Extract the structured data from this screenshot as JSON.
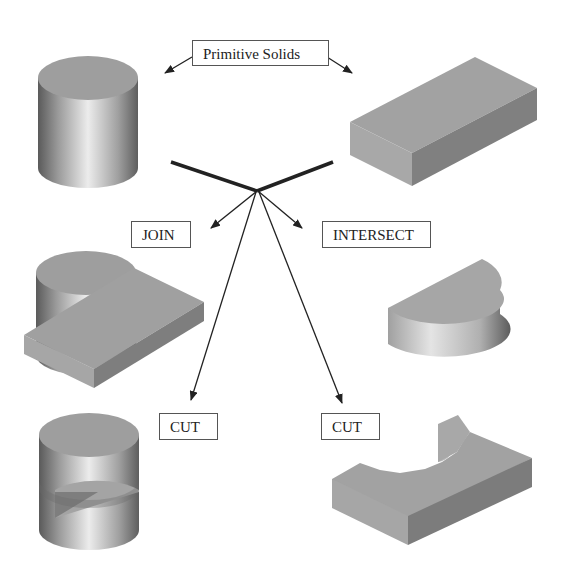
{
  "diagram": {
    "title_label": "Primitive Solids",
    "operations": [
      {
        "label": "JOIN"
      },
      {
        "label": "INTERSECT"
      },
      {
        "label": "CUT"
      },
      {
        "label": "CUT"
      }
    ],
    "solids": [
      {
        "name": "cylinder",
        "role": "primitive"
      },
      {
        "name": "box",
        "role": "primitive"
      },
      {
        "name": "joined-cylinder-box",
        "role": "result-join"
      },
      {
        "name": "intersected-half-cylinder",
        "role": "result-intersect"
      },
      {
        "name": "cylinder-minus-box",
        "role": "result-cut"
      },
      {
        "name": "box-minus-cylinder",
        "role": "result-cut"
      }
    ],
    "colors": {
      "face_top": "#9a9a9a",
      "face_side_light": "#a8a8a8",
      "face_side_dark": "#7c7c7c",
      "line": "#222222",
      "label_border": "#555555"
    }
  }
}
